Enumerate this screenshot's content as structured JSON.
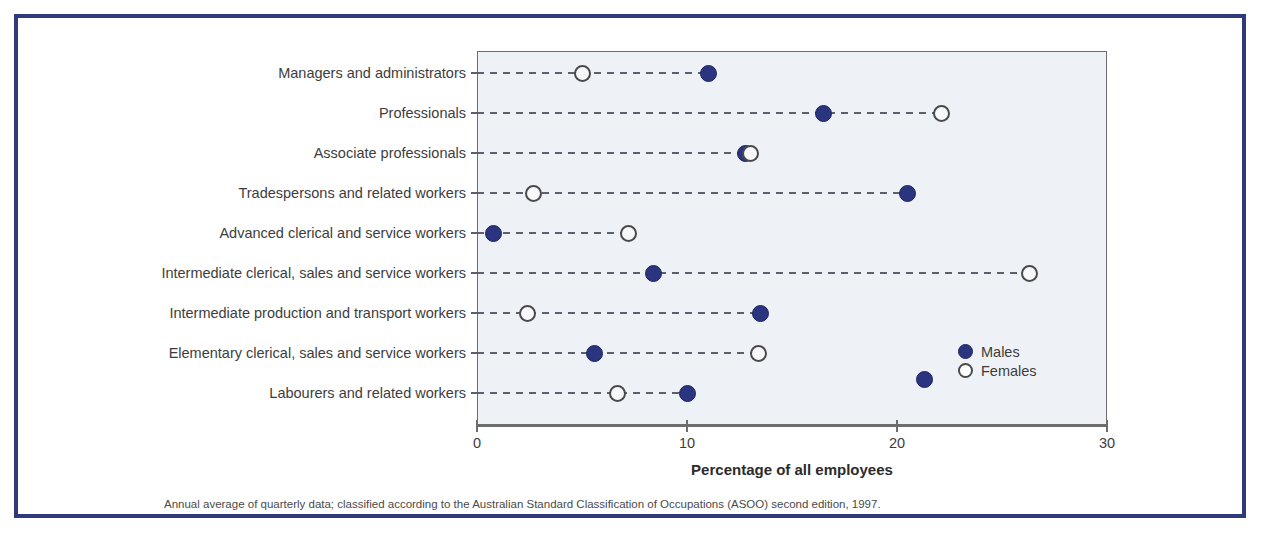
{
  "figure": {
    "frame_color": "#2e3a7d",
    "plot_background": "#eef2f6",
    "male_color": "#2b357f",
    "female_color": "#ffffff"
  },
  "legend": {
    "position": "inside-right",
    "entries": [
      {
        "label": "Males",
        "marker": "filled-circle-icon"
      },
      {
        "label": "Females",
        "marker": "hollow-circle-icon"
      }
    ]
  },
  "footnote": "Annual average of quarterly data; classified according to the Australian Standard Classification of Occupations (ASOO) second edition, 1997.",
  "chart_data": {
    "type": "scatter",
    "title": "",
    "xlabel": "Percentage of all employees",
    "ylabel": "",
    "xlim": [
      0,
      30
    ],
    "xticks": [
      0,
      10,
      20,
      30
    ],
    "xtick_labels": [
      "0",
      "10",
      "20",
      "30"
    ],
    "grid": false,
    "orientation": "horizontal-dot-plot",
    "categories": [
      "Managers and administrators",
      "Professionals",
      "Associate professionals",
      "Tradespersons and related workers",
      "Advanced clerical and service workers",
      "Intermediate clerical, sales and service workers",
      "Intermediate production and transport workers",
      "Elementary clerical, sales and service workers",
      "Labourers and related workers"
    ],
    "series": [
      {
        "name": "Males",
        "marker": "filled-circle-icon",
        "color": "#2b357f",
        "values": [
          11.0,
          16.5,
          12.8,
          20.5,
          0.8,
          8.4,
          13.5,
          5.6,
          10.0
        ]
      },
      {
        "name": "Females",
        "marker": "hollow-circle-icon",
        "color": "#ffffff",
        "values": [
          5.0,
          22.1,
          13.0,
          2.7,
          7.2,
          26.3,
          2.4,
          13.4,
          6.7
        ]
      }
    ],
    "stray_marker": {
      "series": "Males",
      "value": 21.3,
      "between_categories": [
        7,
        8
      ]
    }
  }
}
